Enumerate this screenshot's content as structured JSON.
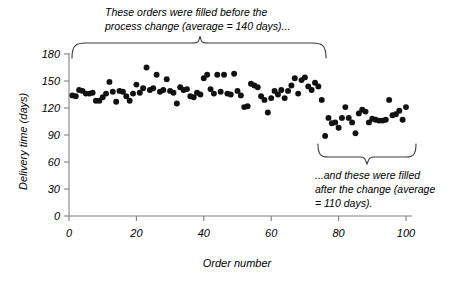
{
  "figure": {
    "background": "#ffffff",
    "marker_color": "#111111",
    "axis_color": "#808080",
    "brace_color": "#3a3a3a"
  },
  "annotations": {
    "top": {
      "line1": "These orders were filled before the",
      "line2": "process change (average = 140 days)..."
    },
    "bottom": {
      "line1": "...and these were filled",
      "line2": "after the change (average",
      "line3": "= 110 days)."
    }
  },
  "chart_data": {
    "type": "scatter",
    "title": "",
    "xlabel": "Order number",
    "ylabel": "Delivery time (days)",
    "xlim": [
      0,
      100
    ],
    "ylim": [
      0,
      180
    ],
    "xticks": [
      0,
      20,
      40,
      60,
      80,
      100
    ],
    "yticks": [
      0,
      30,
      60,
      90,
      120,
      150,
      180
    ],
    "xticklabels": [
      "0",
      "20",
      "40",
      "60",
      "80",
      "100"
    ],
    "yticklabels": [
      "0",
      "30",
      "60",
      "90",
      "120",
      "150",
      "180"
    ],
    "grid": false,
    "legend": null,
    "marker": "circle",
    "marker_size": 4,
    "series": [
      {
        "name": "Before process change",
        "mean": 140,
        "x": [
          1,
          2,
          3,
          4,
          5,
          6,
          7,
          8,
          9,
          10,
          11,
          12,
          13,
          14,
          15,
          16,
          17,
          18,
          19,
          20,
          21,
          22,
          23,
          24,
          25,
          26,
          27,
          28,
          29,
          30,
          31,
          32,
          33,
          34,
          35,
          36,
          37,
          38,
          39,
          40,
          41,
          42,
          43,
          44,
          45,
          46,
          47,
          48,
          49,
          50,
          51,
          52,
          53,
          54,
          55,
          56,
          57,
          58,
          59,
          60,
          61,
          62,
          63,
          64,
          65,
          66,
          67,
          68,
          69,
          70,
          71,
          72,
          73,
          74,
          75
        ],
        "y": [
          134,
          133,
          140,
          139,
          136,
          136,
          137,
          128,
          128,
          132,
          136,
          149,
          138,
          127,
          139,
          138,
          133,
          128,
          136,
          146,
          137,
          142,
          165,
          140,
          142,
          157,
          138,
          140,
          152,
          139,
          137,
          125,
          143,
          140,
          141,
          133,
          132,
          137,
          135,
          153,
          157,
          141,
          136,
          157,
          138,
          157,
          136,
          135,
          158,
          139,
          134,
          121,
          122,
          147,
          145,
          143,
          133,
          129,
          115,
          131,
          139,
          135,
          140,
          131,
          139,
          145,
          153,
          136,
          151,
          154,
          144,
          140,
          148,
          144,
          129
        ]
      },
      {
        "name": "After process change",
        "mean": 110,
        "x": [
          76,
          77,
          78,
          79,
          80,
          81,
          82,
          83,
          84,
          85,
          86,
          87,
          88,
          89,
          90,
          91,
          92,
          93,
          94,
          95,
          96,
          97,
          98,
          99,
          100
        ],
        "y": [
          89,
          109,
          103,
          104,
          98,
          109,
          121,
          109,
          104,
          92,
          114,
          118,
          116,
          104,
          108,
          107,
          106,
          106,
          107,
          129,
          112,
          113,
          117,
          107,
          121
        ]
      }
    ]
  }
}
